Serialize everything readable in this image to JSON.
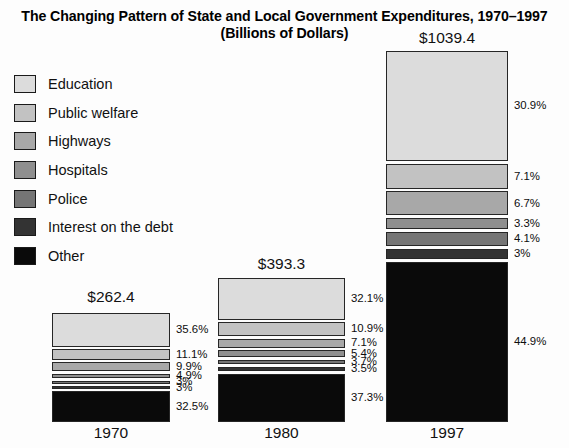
{
  "title": {
    "line1": "The Changing Pattern of State and Local Government Expenditures, 1970–1997",
    "line2": "(Billions of Dollars)"
  },
  "legend": {
    "items": [
      {
        "label": "Education",
        "color": "#dcdcdc"
      },
      {
        "label": "Public welfare",
        "color": "#c2c2c2"
      },
      {
        "label": "Highways",
        "color": "#a8a8a8"
      },
      {
        "label": "Hospitals",
        "color": "#8f8f8f"
      },
      {
        "label": "Police",
        "color": "#757575"
      },
      {
        "label": "Interest on the debt",
        "color": "#333333"
      },
      {
        "label": "Other",
        "color": "#0a0a0a"
      }
    ]
  },
  "chart_data": {
    "type": "bar",
    "title": "The Changing Pattern of State and Local Government Expenditures, 1970–1997",
    "subtitle": "(Billions of Dollars)",
    "xlabel": "",
    "ylabel": "Billions of Dollars",
    "stacked": true,
    "normalized_percent": true,
    "grid": false,
    "legend_position": "left",
    "categories": [
      "1970",
      "1980",
      "1997"
    ],
    "totals": [
      262.4,
      393.3,
      1039.4
    ],
    "total_labels": [
      "$262.4",
      "$393.3",
      "$1039.4"
    ],
    "series": [
      {
        "name": "Education",
        "color": "#dcdcdc",
        "values": [
          35.6,
          32.1,
          30.9
        ],
        "labels": [
          "35.6%",
          "32.1%",
          "30.9%"
        ]
      },
      {
        "name": "Public welfare",
        "color": "#c2c2c2",
        "values": [
          11.1,
          10.9,
          7.1
        ],
        "labels": [
          "11.1%",
          "10.9%",
          "7.1%"
        ]
      },
      {
        "name": "Highways",
        "color": "#a8a8a8",
        "values": [
          9.9,
          7.1,
          6.7
        ],
        "labels": [
          "9.9%",
          "7.1%",
          "6.7%"
        ]
      },
      {
        "name": "Hospitals",
        "color": "#8f8f8f",
        "values": [
          4.9,
          5.4,
          3.3
        ],
        "labels": [
          "4.9%",
          "5.4%",
          "3.3%"
        ]
      },
      {
        "name": "Police",
        "color": "#757575",
        "values": [
          3.0,
          3.7,
          4.1
        ],
        "labels": [
          "3%",
          "3.7%",
          "4.1%"
        ]
      },
      {
        "name": "Interest on the debt",
        "color": "#333333",
        "values": [
          3.0,
          3.5,
          3.0
        ],
        "labels": [
          "3%",
          "3.5%",
          "3%"
        ]
      },
      {
        "name": "Other",
        "color": "#0a0a0a",
        "values": [
          32.5,
          37.3,
          44.9
        ],
        "labels": [
          "32.5%",
          "37.3%",
          "44.9%"
        ]
      }
    ],
    "bars": [
      {
        "year": "1970",
        "total_label": "$262.4",
        "segments": [
          {
            "name": "Education",
            "percent": 35.6,
            "label": "35.6%",
            "color": "#dcdcdc"
          },
          {
            "name": "Public welfare",
            "percent": 11.1,
            "label": "11.1%",
            "color": "#c2c2c2"
          },
          {
            "name": "Highways",
            "percent": 9.9,
            "label": "9.9%",
            "color": "#a8a8a8"
          },
          {
            "name": "Hospitals",
            "percent": 4.9,
            "label": "4.9%",
            "color": "#8f8f8f"
          },
          {
            "name": "Police",
            "percent": 3.0,
            "label": "3%",
            "color": "#757575"
          },
          {
            "name": "Interest on the debt",
            "percent": 3.0,
            "label": "3%",
            "color": "#333333"
          },
          {
            "name": "Other",
            "percent": 32.5,
            "label": "32.5%",
            "color": "#0a0a0a"
          }
        ]
      },
      {
        "year": "1980",
        "total_label": "$393.3",
        "segments": [
          {
            "name": "Education",
            "percent": 32.1,
            "label": "32.1%",
            "color": "#dcdcdc"
          },
          {
            "name": "Public welfare",
            "percent": 10.9,
            "label": "10.9%",
            "color": "#c2c2c2"
          },
          {
            "name": "Highways",
            "percent": 7.1,
            "label": "7.1%",
            "color": "#a8a8a8"
          },
          {
            "name": "Hospitals",
            "percent": 5.4,
            "label": "5.4%",
            "color": "#8f8f8f"
          },
          {
            "name": "Police",
            "percent": 3.7,
            "label": "3.7%",
            "color": "#757575"
          },
          {
            "name": "Interest on the debt",
            "percent": 3.5,
            "label": "3.5%",
            "color": "#333333"
          },
          {
            "name": "Other",
            "percent": 37.3,
            "label": "37.3%",
            "color": "#0a0a0a"
          }
        ]
      },
      {
        "year": "1997",
        "total_label": "$1039.4",
        "segments": [
          {
            "name": "Education",
            "percent": 30.9,
            "label": "30.9%",
            "color": "#dcdcdc"
          },
          {
            "name": "Public welfare",
            "percent": 7.1,
            "label": "7.1%",
            "color": "#c2c2c2"
          },
          {
            "name": "Highways",
            "percent": 6.7,
            "label": "6.7%",
            "color": "#a8a8a8"
          },
          {
            "name": "Hospitals",
            "percent": 3.3,
            "label": "3.3%",
            "color": "#8f8f8f"
          },
          {
            "name": "Police",
            "percent": 4.1,
            "label": "4.1%",
            "color": "#757575"
          },
          {
            "name": "Interest on the debt",
            "percent": 3.0,
            "label": "3%",
            "color": "#333333"
          },
          {
            "name": "Other",
            "percent": 44.9,
            "label": "44.9%",
            "color": "#0a0a0a"
          }
        ]
      }
    ]
  },
  "layout": {
    "bars": [
      {
        "left": 52,
        "width": 118,
        "top": 313,
        "height": 109,
        "total_top": 288,
        "year_top": 424
      },
      {
        "left": 218,
        "width": 127,
        "top": 278,
        "height": 144,
        "total_top": 255,
        "year_top": 424
      },
      {
        "left": 386,
        "width": 122,
        "top": 51,
        "height": 371,
        "total_top": 29,
        "year_top": 424
      }
    ],
    "label_offset_x": 6,
    "gap": 2.4
  }
}
